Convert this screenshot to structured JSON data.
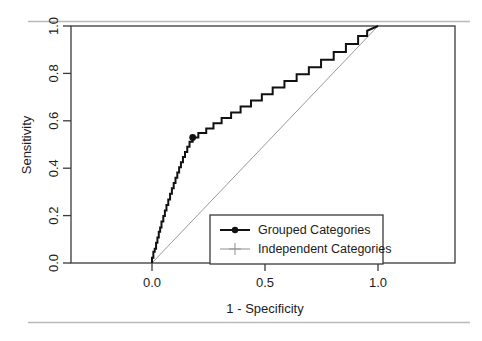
{
  "figure": {
    "background_color": "#ffffff",
    "page_rule_color": "#b9b9b9",
    "frame_color": "#3a3a3a"
  },
  "chart_data": {
    "type": "line",
    "title": "",
    "subtitle": "",
    "xlabel": "1 - Specificity",
    "ylabel": "Sensitivity",
    "xlim": [
      -0.18,
      1.22
    ],
    "ylim": [
      -0.09,
      1.06
    ],
    "xticks": [
      0.0,
      0.5,
      1.0
    ],
    "xticklabels": [
      "0.0",
      "0.5",
      "1.0"
    ],
    "yticks": [
      0.0,
      0.2,
      0.4,
      0.6,
      0.8,
      1.0
    ],
    "yticklabels": [
      "0.0",
      "0.2",
      "0.4",
      "0.6",
      "0.8",
      "1.0"
    ],
    "grid": false,
    "legend_position": "bottom-right",
    "series": [
      {
        "name": "Grouped Categories",
        "color": "#111111",
        "style": "step",
        "marker": "filled-circle",
        "linewidth": 2.0,
        "marker_points": [
          [
            0.18,
            0.53
          ]
        ],
        "points": [
          [
            0.0,
            0.0
          ],
          [
            0.0,
            0.022
          ],
          [
            0.006,
            0.022
          ],
          [
            0.006,
            0.047
          ],
          [
            0.012,
            0.047
          ],
          [
            0.012,
            0.06
          ],
          [
            0.018,
            0.06
          ],
          [
            0.018,
            0.085
          ],
          [
            0.024,
            0.085
          ],
          [
            0.024,
            0.108
          ],
          [
            0.03,
            0.108
          ],
          [
            0.03,
            0.132
          ],
          [
            0.036,
            0.132
          ],
          [
            0.036,
            0.15
          ],
          [
            0.042,
            0.15
          ],
          [
            0.042,
            0.175
          ],
          [
            0.05,
            0.175
          ],
          [
            0.05,
            0.198
          ],
          [
            0.057,
            0.198
          ],
          [
            0.057,
            0.222
          ],
          [
            0.064,
            0.222
          ],
          [
            0.064,
            0.245
          ],
          [
            0.072,
            0.245
          ],
          [
            0.072,
            0.268
          ],
          [
            0.08,
            0.268
          ],
          [
            0.08,
            0.292
          ],
          [
            0.088,
            0.292
          ],
          [
            0.088,
            0.315
          ],
          [
            0.096,
            0.315
          ],
          [
            0.096,
            0.338
          ],
          [
            0.104,
            0.338
          ],
          [
            0.104,
            0.36
          ],
          [
            0.112,
            0.36
          ],
          [
            0.112,
            0.382
          ],
          [
            0.12,
            0.382
          ],
          [
            0.12,
            0.404
          ],
          [
            0.128,
            0.404
          ],
          [
            0.128,
            0.425
          ],
          [
            0.137,
            0.425
          ],
          [
            0.137,
            0.447
          ],
          [
            0.146,
            0.447
          ],
          [
            0.146,
            0.468
          ],
          [
            0.156,
            0.468
          ],
          [
            0.156,
            0.49
          ],
          [
            0.166,
            0.49
          ],
          [
            0.166,
            0.512
          ],
          [
            0.18,
            0.512
          ],
          [
            0.18,
            0.53
          ],
          [
            0.205,
            0.53
          ],
          [
            0.205,
            0.548
          ],
          [
            0.24,
            0.548
          ],
          [
            0.24,
            0.568
          ],
          [
            0.272,
            0.568
          ],
          [
            0.272,
            0.59
          ],
          [
            0.308,
            0.59
          ],
          [
            0.308,
            0.612
          ],
          [
            0.35,
            0.612
          ],
          [
            0.35,
            0.635
          ],
          [
            0.392,
            0.635
          ],
          [
            0.392,
            0.66
          ],
          [
            0.438,
            0.66
          ],
          [
            0.438,
            0.686
          ],
          [
            0.486,
            0.686
          ],
          [
            0.486,
            0.712
          ],
          [
            0.534,
            0.712
          ],
          [
            0.534,
            0.74
          ],
          [
            0.586,
            0.74
          ],
          [
            0.586,
            0.768
          ],
          [
            0.64,
            0.768
          ],
          [
            0.64,
            0.796
          ],
          [
            0.694,
            0.796
          ],
          [
            0.694,
            0.826
          ],
          [
            0.748,
            0.826
          ],
          [
            0.748,
            0.858
          ],
          [
            0.804,
            0.858
          ],
          [
            0.804,
            0.89
          ],
          [
            0.858,
            0.89
          ],
          [
            0.858,
            0.924
          ],
          [
            0.912,
            0.924
          ],
          [
            0.912,
            0.958
          ],
          [
            0.952,
            0.958
          ],
          [
            0.952,
            0.98
          ],
          [
            1.0,
            1.0
          ]
        ]
      },
      {
        "name": "Independent Categories",
        "color": "#9a9a9a",
        "style": "line",
        "marker": "plus",
        "linewidth": 1.0,
        "marker_points": [],
        "points": [
          [
            0.0,
            0.0
          ],
          [
            1.0,
            1.0
          ]
        ]
      }
    ]
  },
  "legend": {
    "entries": [
      {
        "label": "Grouped Categories",
        "marker": "filled-circle",
        "color": "#111111"
      },
      {
        "label": "Independent Categories",
        "marker": "plus",
        "color": "#9a9a9a"
      }
    ]
  }
}
